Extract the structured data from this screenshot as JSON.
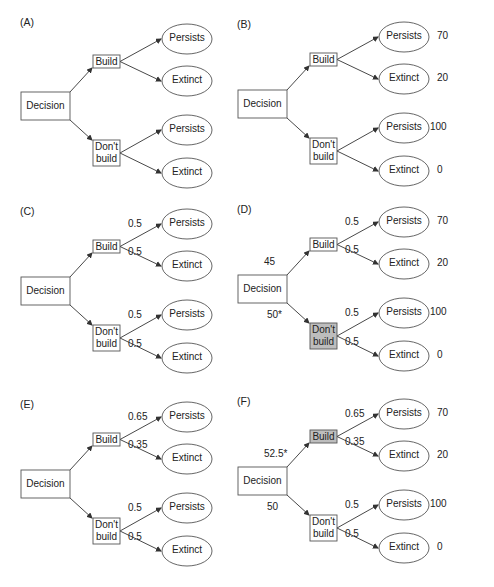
{
  "colors": {
    "line": "#333333",
    "shaded": "#bdbdbd",
    "box": "#ffffff"
  },
  "panels": [
    {
      "id": "A",
      "label": "(A)",
      "decision": {
        "label": "Decision",
        "value": ""
      },
      "build": {
        "label": "Build",
        "shaded": false
      },
      "dont_build": {
        "label": "Don't\nbuild",
        "shaded": false
      },
      "outcomes": [
        {
          "label": "Persists",
          "prob": "",
          "payoff": ""
        },
        {
          "label": "Extinct",
          "prob": "",
          "payoff": ""
        },
        {
          "label": "Persists",
          "prob": "",
          "payoff": ""
        },
        {
          "label": "Extinct",
          "prob": "",
          "payoff": ""
        }
      ],
      "build_value": "",
      "dont_build_value": ""
    },
    {
      "id": "B",
      "label": "(B)",
      "decision": {
        "label": "Decision"
      },
      "build": {
        "label": "Build",
        "shaded": false
      },
      "dont_build": {
        "label": "Don't\nbuild",
        "shaded": false
      },
      "outcomes": [
        {
          "label": "Persists",
          "prob": "",
          "payoff": "70"
        },
        {
          "label": "Extinct",
          "prob": "",
          "payoff": "20"
        },
        {
          "label": "Persists",
          "prob": "",
          "payoff": "100"
        },
        {
          "label": "Extinct",
          "prob": "",
          "payoff": "0"
        }
      ],
      "build_value": "",
      "dont_build_value": ""
    },
    {
      "id": "C",
      "label": "(C)",
      "decision": {
        "label": "Decision"
      },
      "build": {
        "label": "Build",
        "shaded": false
      },
      "dont_build": {
        "label": "Don't\nbuild",
        "shaded": false
      },
      "outcomes": [
        {
          "label": "Persists",
          "prob": "0.5",
          "payoff": ""
        },
        {
          "label": "Extinct",
          "prob": "0.5",
          "payoff": ""
        },
        {
          "label": "Persists",
          "prob": "0.5",
          "payoff": ""
        },
        {
          "label": "Extinct",
          "prob": "0.5",
          "payoff": ""
        }
      ],
      "build_value": "",
      "dont_build_value": ""
    },
    {
      "id": "D",
      "label": "(D)",
      "decision": {
        "label": "Decision"
      },
      "build": {
        "label": "Build",
        "shaded": false
      },
      "dont_build": {
        "label": "Don't\nbuild",
        "shaded": true
      },
      "outcomes": [
        {
          "label": "Persists",
          "prob": "0.5",
          "payoff": "70"
        },
        {
          "label": "Extinct",
          "prob": "0.5",
          "payoff": "20"
        },
        {
          "label": "Persists",
          "prob": "0.5",
          "payoff": "100"
        },
        {
          "label": "Extinct",
          "prob": "0.5",
          "payoff": "0"
        }
      ],
      "build_value": "45",
      "dont_build_value": "50*"
    },
    {
      "id": "E",
      "label": "(E)",
      "decision": {
        "label": "Decision"
      },
      "build": {
        "label": "Build",
        "shaded": false
      },
      "dont_build": {
        "label": "Don't\nbuild",
        "shaded": false
      },
      "outcomes": [
        {
          "label": "Persists",
          "prob": "0.65",
          "payoff": ""
        },
        {
          "label": "Extinct",
          "prob": "0.35",
          "payoff": ""
        },
        {
          "label": "Persists",
          "prob": "0.5",
          "payoff": ""
        },
        {
          "label": "Extinct",
          "prob": "0.5",
          "payoff": ""
        }
      ],
      "build_value": "",
      "dont_build_value": ""
    },
    {
      "id": "F",
      "label": "(F)",
      "decision": {
        "label": "Decision"
      },
      "build": {
        "label": "Build",
        "shaded": true
      },
      "dont_build": {
        "label": "Don't\nbuild",
        "shaded": false
      },
      "outcomes": [
        {
          "label": "Persists",
          "prob": "0.65",
          "payoff": "70"
        },
        {
          "label": "Extinct",
          "prob": "0.35",
          "payoff": "20"
        },
        {
          "label": "Persists",
          "prob": "0.5",
          "payoff": "100"
        },
        {
          "label": "Extinct",
          "prob": "0.5",
          "payoff": "0"
        }
      ],
      "build_value": "52.5*",
      "dont_build_value": "50"
    }
  ]
}
